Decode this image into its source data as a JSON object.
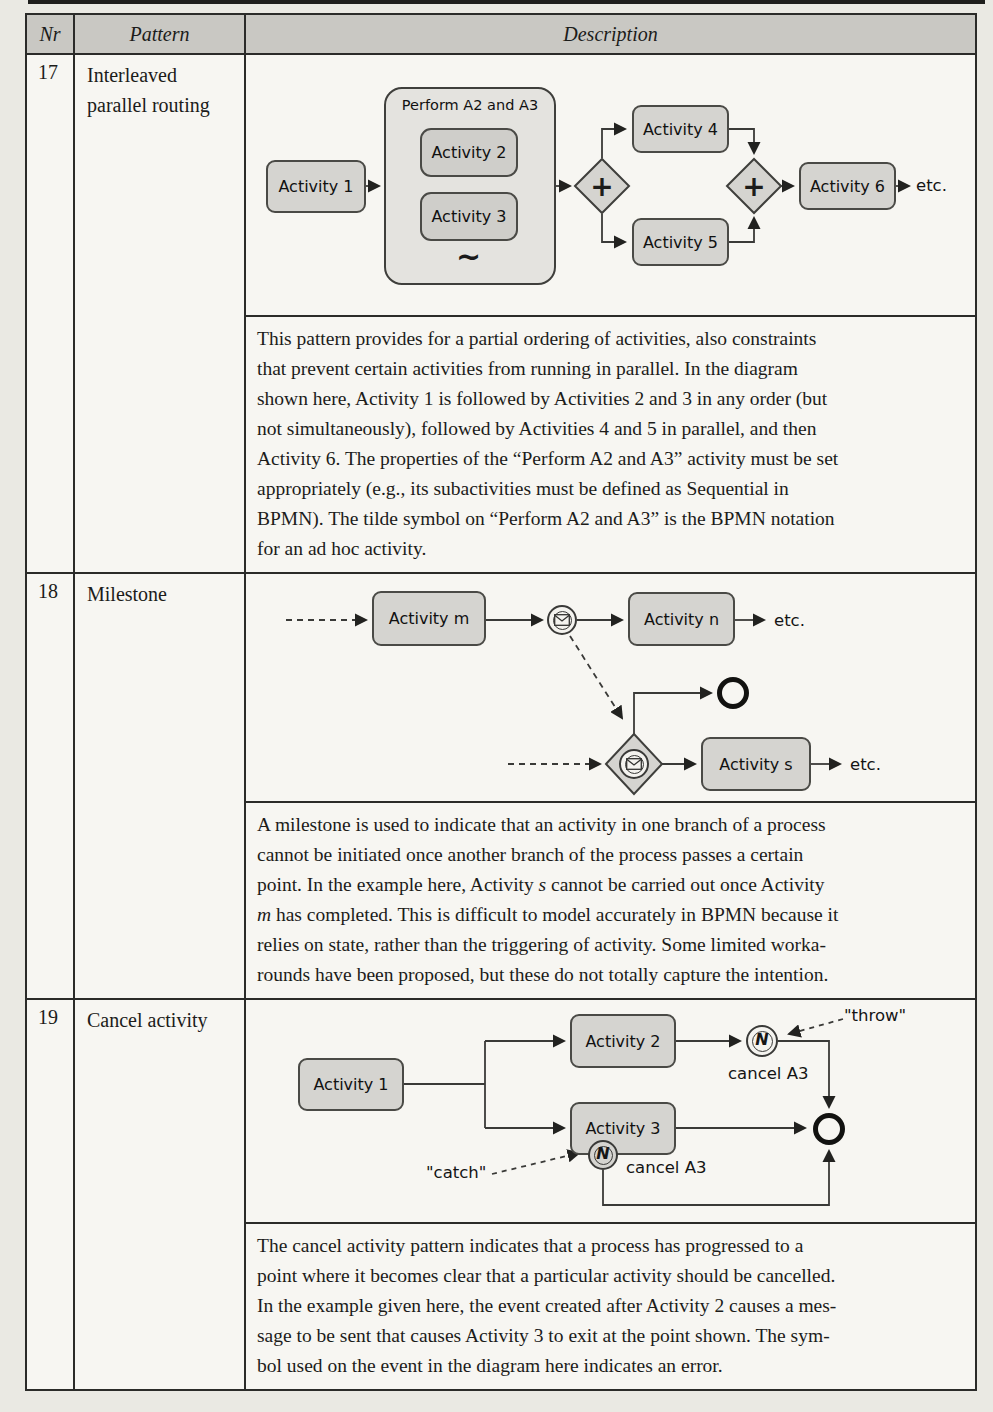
{
  "table": {
    "headers": {
      "nr": "Nr",
      "pattern": "Pattern",
      "description": "Description"
    },
    "rows": [
      {
        "nr": "17",
        "pattern": "Interleaved parallel routing",
        "diagram": {
          "activity1": "Activity 1",
          "subprocess_title": "Perform A2 and A3",
          "activity2": "Activity 2",
          "activity3": "Activity 3",
          "adhoc_symbol": "~",
          "gateway_symbol": "+",
          "activity4": "Activity 4",
          "activity5": "Activity 5",
          "activity6": "Activity 6",
          "etc": "etc."
        },
        "description_lines": [
          [
            "This pattern provides for a partial ordering of activities, also constraints"
          ],
          [
            "that prevent certain activities from running in parallel. In the diagram"
          ],
          [
            "shown here, Activity 1 is followed by Activities 2 and 3 in any order (but"
          ],
          [
            "not simultaneously), followed by Activities 4 and 5 in parallel, and then"
          ],
          [
            "Activity 6. The properties of the “Perform A2 and A3” activity must be set"
          ],
          [
            "appropriately (e.g., its subactivities must be defined as Sequential in"
          ],
          [
            "BPMN). The tilde symbol on “Perform A2 and A3” is the BPMN notation"
          ],
          [
            "for an ad hoc activity."
          ]
        ]
      },
      {
        "nr": "18",
        "pattern": "Milestone",
        "diagram": {
          "activity_m": "Activity m",
          "activity_n": "Activity n",
          "activity_s": "Activity s",
          "etc_top": "etc.",
          "etc_bottom": "etc."
        },
        "description_lines": [
          [
            "A milestone is used to indicate that an activity in one branch of a process"
          ],
          [
            "cannot be initiated once another branch of the process passes a certain"
          ],
          [
            "point. In the example here, Activity ",
            {
              "t": "s",
              "i": true
            },
            " cannot be carried out once Activity"
          ],
          [
            {
              "t": "m",
              "i": true
            },
            " has completed. This is difficult to model accurately in BPMN because it"
          ],
          [
            "relies on state, rather than the triggering of activity. Some limited worka-"
          ],
          [
            "rounds have been proposed, but these do not totally capture the intention."
          ]
        ]
      },
      {
        "nr": "19",
        "pattern": "Cancel activity",
        "diagram": {
          "activity1": "Activity 1",
          "activity2": "Activity 2",
          "activity3": "Activity 3",
          "throw_label": "\"throw\"",
          "catch_label": "\"catch\"",
          "cancel_a3_top": "cancel A3",
          "cancel_a3_bottom": "cancel A3",
          "event_symbol": "N"
        },
        "description_lines": [
          [
            "The cancel activity pattern indicates that a process has progressed to a"
          ],
          [
            "point where it becomes clear that a particular activity should be cancelled."
          ],
          [
            "In the example given here, the event created after Activity 2 causes a mes-"
          ],
          [
            "sage to be sent that causes Activity 3 to exit at the point shown. The sym-"
          ],
          [
            "bol used on the event in the diagram here indicates an error."
          ]
        ]
      }
    ]
  }
}
